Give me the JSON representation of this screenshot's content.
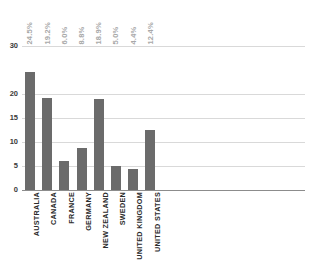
{
  "chart_data": {
    "type": "bar",
    "title": "",
    "xlabel": "",
    "ylabel": "",
    "categories": [
      "AUSTRALIA",
      "CANADA",
      "FRANCE",
      "GERMANY",
      "NEW ZEALAND",
      "SWEDEN",
      "UNITED KINGDOM",
      "UNITED STATES"
    ],
    "values": [
      24.5,
      19.2,
      6.0,
      8.8,
      18.9,
      5.0,
      4.4,
      12.4
    ],
    "data_labels": [
      "24.5%",
      "19.2%",
      "6.0%",
      "8.8%",
      "18.9%",
      "5.0%",
      "4.4%",
      "12.4%"
    ],
    "ylim": [
      0,
      30
    ],
    "yticks": [
      0,
      5,
      10,
      15,
      20,
      30
    ],
    "ytick_labels": [
      "0",
      "5",
      "10",
      "15",
      "20",
      "30"
    ],
    "grid": true,
    "legend": "none",
    "series_color": "#6b6b6b",
    "gridline_color": "#d9d9d9",
    "axis_color": "#8c8c8c",
    "data_label_color": "#a8a8a8",
    "category_label_color": "#2b2b2b"
  }
}
